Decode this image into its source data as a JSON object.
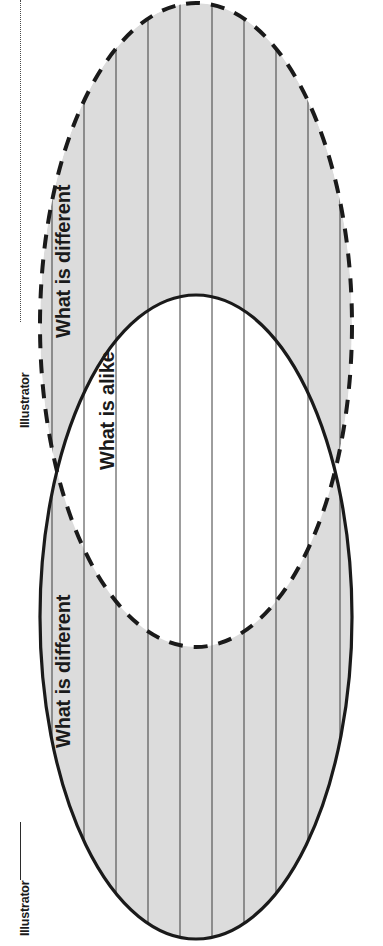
{
  "page": {
    "orientation": "landscape-rotated",
    "background_color": "#ffffff",
    "width": 383,
    "height": 946
  },
  "diagram": {
    "type": "venn-two-circle",
    "fill_color": "#dcdcdc",
    "stroke_color": "#1a1a1a",
    "rule_color": "#3c3c3c",
    "ellipses": [
      {
        "id": "ellipse-dashed",
        "name": "upper-set",
        "stroke_style": "dashed",
        "cx": 196,
        "cy": 325,
        "rx": 156,
        "ry": 322
      },
      {
        "id": "ellipse-solid",
        "name": "lower-set",
        "stroke_style": "solid",
        "cx": 196,
        "cy": 617,
        "rx": 156,
        "ry": 322
      }
    ],
    "labels": {
      "difference_top": "What is different",
      "intersection": "What is alike",
      "difference_bottom": "What is different"
    },
    "writing_lines": {
      "count": 11,
      "spacing": 32
    }
  },
  "credits": {
    "top": "Illustrator",
    "bottom": "Illustrator"
  }
}
